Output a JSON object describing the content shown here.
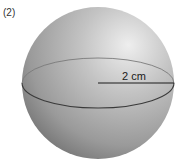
{
  "figure": {
    "problem_number": "(2)",
    "shape": "sphere",
    "radius_label": "2 cm",
    "colors": {
      "sphere_light": "#e6e6e6",
      "sphere_mid": "#a8a8a8",
      "sphere_dark": "#6e6e6e",
      "equator_front": "#3a3a3a",
      "equator_back": "#7a7a7a",
      "radius_line": "#1a1a1a"
    }
  }
}
